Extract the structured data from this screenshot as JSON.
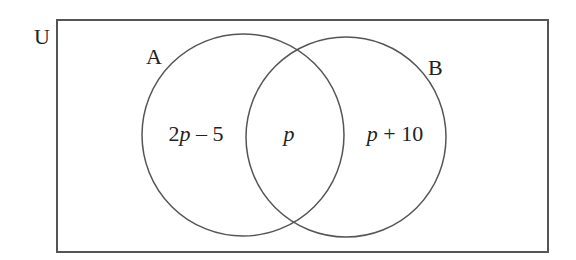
{
  "diagram": {
    "type": "venn",
    "universe": {
      "label": "U",
      "rect": {
        "x": 57,
        "y": 20,
        "width": 491,
        "height": 232
      },
      "label_pos": {
        "x": 34,
        "y": 44
      }
    },
    "sets": [
      {
        "id": "A",
        "label": "A",
        "circle": {
          "cx": 243,
          "cy": 135,
          "r": 101
        },
        "label_pos": {
          "x": 146,
          "y": 64
        }
      },
      {
        "id": "B",
        "label": "B",
        "circle": {
          "cx": 346,
          "cy": 137,
          "r": 100
        },
        "label_pos": {
          "x": 428,
          "y": 75
        }
      }
    ],
    "regions": [
      {
        "id": "A_only",
        "text_coef": "2",
        "text_var": "p",
        "text_rest": " – 5",
        "full": "2p – 5",
        "pos": {
          "x": 196,
          "y": 141
        }
      },
      {
        "id": "A_and_B",
        "text_coef": "",
        "text_var": "p",
        "text_rest": "",
        "full": "p",
        "pos": {
          "x": 289,
          "y": 141
        }
      },
      {
        "id": "B_only",
        "text_coef": "",
        "text_var": "p",
        "text_rest": " + 10",
        "full": "p + 10",
        "pos": {
          "x": 395,
          "y": 141
        }
      }
    ],
    "colors": {
      "stroke": "#555555",
      "text": "#222222",
      "background": "#ffffff"
    }
  }
}
